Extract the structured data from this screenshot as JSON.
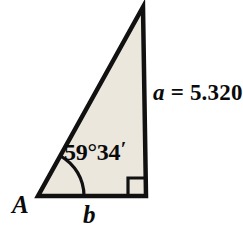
{
  "figure": {
    "type": "right-triangle-diagram",
    "background_color": "#ffffff",
    "fill_color": "#ece7dd",
    "stroke_color": "#111111",
    "stroke_width": 4,
    "vertices": {
      "apex": {
        "x": 143,
        "y": 7
      },
      "lower_left": {
        "x": 38,
        "y": 196
      },
      "lower_right": {
        "x": 146,
        "y": 196
      }
    },
    "right_angle_marker": {
      "present": true,
      "at_vertex": "lower_right",
      "size": 18
    },
    "angle_arc": {
      "at_vertex": "lower_left",
      "radius": 46
    }
  },
  "labels": {
    "vertex_a": "A",
    "side_b": "b",
    "side_a_variable": "a",
    "side_a_equals": " = ",
    "side_a_value": "5.320",
    "side_a_full": "a = 5.320",
    "angle_degrees": "59",
    "angle_degree_symbol": "°",
    "angle_minutes": "34",
    "angle_prime_symbol": "′",
    "angle_full": "59°34′"
  },
  "chart_data": {
    "type": "diagram",
    "shape": "right triangle",
    "known_values": [
      {
        "name": "A",
        "kind": "angle",
        "value": "59°34′"
      },
      {
        "name": "a",
        "kind": "side",
        "value": "5.320"
      },
      {
        "name": "C",
        "kind": "angle",
        "value": "90°"
      }
    ],
    "unknown_values": [
      {
        "name": "b",
        "kind": "side",
        "value": ""
      }
    ]
  }
}
